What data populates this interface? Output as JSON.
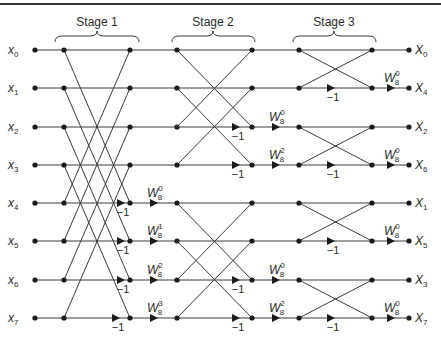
{
  "diagram": {
    "stages": [
      {
        "label": "Stage 1"
      },
      {
        "label": "Stage 2"
      },
      {
        "label": "Stage 3"
      }
    ],
    "inputs": [
      {
        "base": "x",
        "sub": "0"
      },
      {
        "base": "x",
        "sub": "1"
      },
      {
        "base": "x",
        "sub": "2"
      },
      {
        "base": "x",
        "sub": "3"
      },
      {
        "base": "x",
        "sub": "4"
      },
      {
        "base": "x",
        "sub": "5"
      },
      {
        "base": "x",
        "sub": "6"
      },
      {
        "base": "x",
        "sub": "7"
      }
    ],
    "outputs": [
      {
        "base": "X",
        "sub": "0"
      },
      {
        "base": "X",
        "sub": "4"
      },
      {
        "base": "X",
        "sub": "2"
      },
      {
        "base": "X",
        "sub": "6"
      },
      {
        "base": "X",
        "sub": "1"
      },
      {
        "base": "X",
        "sub": "5"
      },
      {
        "base": "X",
        "sub": "3"
      },
      {
        "base": "X",
        "sub": "7"
      }
    ],
    "neg_one": "−1",
    "twiddle_base": "W",
    "twiddle_N": "8",
    "stage1_twiddles": [
      {
        "row": 4,
        "exp": "0"
      },
      {
        "row": 5,
        "exp": "1"
      },
      {
        "row": 6,
        "exp": "2"
      },
      {
        "row": 7,
        "exp": "3"
      }
    ],
    "stage2_twiddles": [
      {
        "row": 2,
        "exp": "0"
      },
      {
        "row": 3,
        "exp": "2"
      },
      {
        "row": 6,
        "exp": "0"
      },
      {
        "row": 7,
        "exp": "2"
      }
    ],
    "stage3_twiddles": [
      {
        "row": 1,
        "exp": "0"
      },
      {
        "row": 3,
        "exp": "0"
      },
      {
        "row": 5,
        "exp": "0"
      },
      {
        "row": 7,
        "exp": "0"
      }
    ]
  }
}
